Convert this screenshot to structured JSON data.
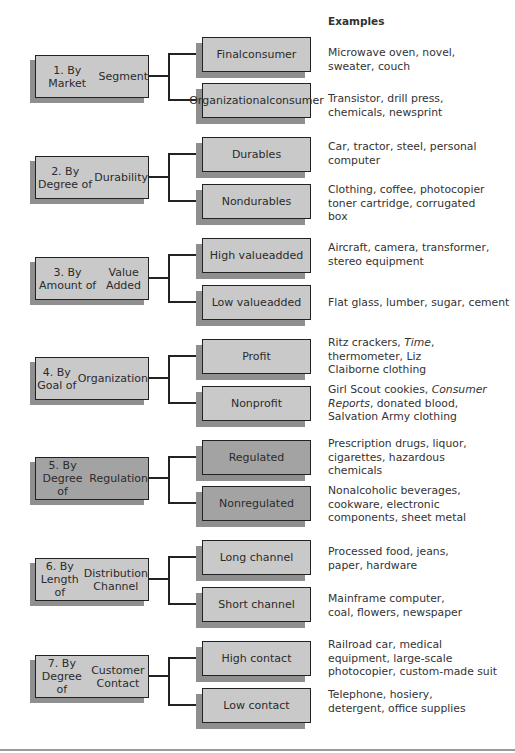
{
  "header": {
    "examples_label": "Examples"
  },
  "groups": [
    {
      "label": "1. By Market Segment",
      "label_lines": [
        "1. By Market",
        "Segment"
      ],
      "shade": "light",
      "children": [
        {
          "label_lines": [
            "Final",
            "consumer"
          ],
          "examples_lines": [
            "Microwave oven, novel,",
            "sweater, couch"
          ]
        },
        {
          "label_lines": [
            "Organizational",
            "consumer"
          ],
          "examples_lines": [
            "Transistor, drill press,",
            "chemicals, newsprint"
          ]
        }
      ]
    },
    {
      "label": "2. By Degree of Durability",
      "label_lines": [
        "2. By Degree of",
        "Durability"
      ],
      "shade": "light",
      "children": [
        {
          "label_lines": [
            "Durables"
          ],
          "examples_lines": [
            "Car, tractor, steel, personal",
            "computer"
          ]
        },
        {
          "label_lines": [
            "Nondurables"
          ],
          "examples_lines": [
            "Clothing, coffee, photocopier",
            "toner cartridge, corrugated",
            "box"
          ]
        }
      ]
    },
    {
      "label": "3. By Amount of Value Added",
      "label_lines": [
        "3. By Amount of",
        "Value Added"
      ],
      "shade": "light",
      "children": [
        {
          "label_lines": [
            "High value",
            "added"
          ],
          "examples_lines": [
            "Aircraft, camera, transformer,",
            "stereo equipment"
          ]
        },
        {
          "label_lines": [
            "Low value",
            "added"
          ],
          "examples_lines": [
            "Flat glass, lumber, sugar, cement"
          ]
        }
      ]
    },
    {
      "label": "4. By Goal of Organization",
      "label_lines": [
        "4. By Goal of",
        "Organization"
      ],
      "shade": "light",
      "children": [
        {
          "label_lines": [
            "Profit"
          ],
          "examples_lines": [
            "Ritz crackers, Time,",
            "thermometer, Liz",
            "Claiborne clothing"
          ]
        },
        {
          "label_lines": [
            "Nonprofit"
          ],
          "examples_lines": [
            "Girl Scout cookies, Consumer",
            "Reports, donated blood,",
            "Salvation Army clothing"
          ]
        }
      ]
    },
    {
      "label": "5. By Degree of Regulation",
      "label_lines": [
        "5. By Degree of",
        "Regulation"
      ],
      "shade": "dark",
      "children": [
        {
          "label_lines": [
            "Regulated"
          ],
          "examples_lines": [
            "Prescription drugs, liquor,",
            "cigarettes, hazardous",
            "chemicals"
          ]
        },
        {
          "label_lines": [
            "Nonregulated"
          ],
          "examples_lines": [
            "Nonalcoholic beverages,",
            "cookware, electronic",
            "components, sheet metal"
          ]
        }
      ]
    },
    {
      "label": "6. By Length of Distribution Channel",
      "label_lines": [
        "6. By Length of",
        "Distribution Channel"
      ],
      "shade": "light",
      "children": [
        {
          "label_lines": [
            "Long channel"
          ],
          "examples_lines": [
            "Processed food, jeans,",
            "paper, hardware"
          ]
        },
        {
          "label_lines": [
            "Short channel"
          ],
          "examples_lines": [
            "Mainframe computer,",
            "coal, flowers, newspaper"
          ]
        }
      ]
    },
    {
      "label": "7. By Degree of Customer Contact",
      "label_lines": [
        "7. By Degree of",
        "Customer Contact"
      ],
      "shade": "light",
      "children": [
        {
          "label_lines": [
            "High contact"
          ],
          "examples_lines": [
            "Railroad car, medical",
            "equipment, large-scale",
            "photocopier, custom-made suit"
          ]
        },
        {
          "label_lines": [
            "Low contact"
          ],
          "examples_lines": [
            "Telephone, hosiery,",
            "detergent, office supplies"
          ]
        }
      ]
    }
  ],
  "italic_terms": [
    "Time",
    "Consumer",
    "Reports"
  ],
  "colors": {
    "light_box": "#c9c9c9",
    "dark_box": "#a3a3a3",
    "shadow": "#8f8f8f",
    "border": "#222222"
  }
}
